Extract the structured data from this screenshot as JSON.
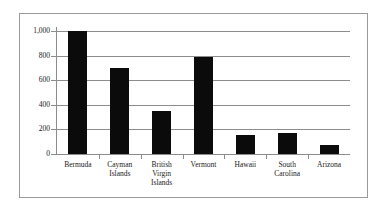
{
  "chart_data": {
    "type": "bar",
    "title": "",
    "subtitle": "",
    "xlabel": "",
    "ylabel": "",
    "categories": [
      "Bermuda",
      "Cayman Islands",
      "British Virgin Islands",
      "Vermont",
      "Hawaii",
      "South Carolina",
      "Arizona"
    ],
    "category_lines": [
      [
        "Bermuda"
      ],
      [
        "Cayman",
        "Islands"
      ],
      [
        "British",
        "Virgin",
        "Islands"
      ],
      [
        "Vermont"
      ],
      [
        "Hawaii"
      ],
      [
        "South",
        "Carolina"
      ],
      [
        "Arizona"
      ]
    ],
    "values": [
      1000,
      700,
      350,
      790,
      155,
      170,
      75
    ],
    "ylim": [
      0,
      1000
    ],
    "yticks": [
      0,
      200,
      400,
      600,
      800,
      1000
    ],
    "ytick_labels": [
      "0",
      "200",
      "400",
      "600",
      "800",
      "1,000"
    ],
    "grid": true,
    "legend": false,
    "legend_position": "none",
    "bar_color": "#0b0b0b",
    "grid_color": "#8c8c8c",
    "axis_color": "#8c8c8c",
    "frame_color": "#9a9a9a",
    "background": "#ffffff"
  }
}
